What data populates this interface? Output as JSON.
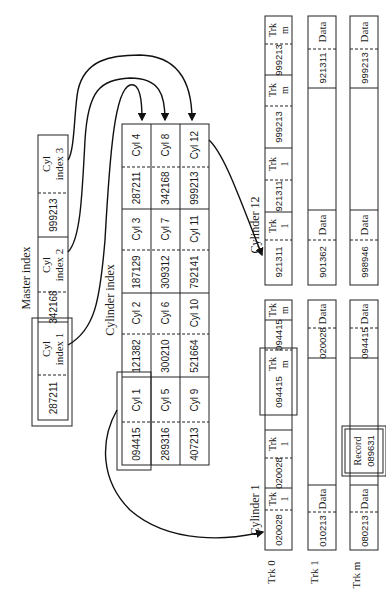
{
  "master_index": {
    "title": "Master index",
    "entries": [
      {
        "key": "287211",
        "label_line1": "Cyl",
        "label_line2": "index 1"
      },
      {
        "key": "342168",
        "label_line1": "Cyl",
        "label_line2": "index 2"
      },
      {
        "key": "999213",
        "label_line1": "Cyl",
        "label_line2": "index 3"
      }
    ]
  },
  "cylinder_index": {
    "title": "Cylinder index",
    "rows": [
      [
        {
          "key": "094415",
          "cyl": "Cyl 1"
        },
        {
          "key": "121382",
          "cyl": "Cyl 2"
        },
        {
          "key": "187129",
          "cyl": "Cyl 3"
        },
        {
          "key": "287211",
          "cyl": "Cyl 4"
        }
      ],
      [
        {
          "key": "289316",
          "cyl": "Cyl 5"
        },
        {
          "key": "300210",
          "cyl": "Cyl 6"
        },
        {
          "key": "309312",
          "cyl": "Cyl 7"
        },
        {
          "key": "342168",
          "cyl": "Cyl 8"
        }
      ],
      [
        {
          "key": "407213",
          "cyl": "Cyl 9"
        },
        {
          "key": "521664",
          "cyl": "Cyl 10"
        },
        {
          "key": "792141",
          "cyl": "Cyl 11"
        },
        {
          "key": "999213",
          "cyl": "Cyl 12"
        }
      ]
    ]
  },
  "cylinder_1": {
    "title": "Cylinder 1",
    "track_labels": [
      "Trk 0",
      "Trk 1",
      "Trk m"
    ],
    "track_index": [
      {
        "key": "020028",
        "trk": "Trk",
        "num": "1"
      },
      {
        "key": "020028",
        "trk": "Trk",
        "num": "1"
      },
      {
        "key": "094415",
        "trk": "Trk",
        "num": "m"
      },
      {
        "key": "094415",
        "trk": "Trk",
        "num": "m"
      }
    ],
    "track_1": [
      {
        "key": "010213",
        "label": "Data"
      },
      {
        "key": "020028",
        "label": "Data"
      }
    ],
    "track_m": [
      {
        "key": "080213",
        "label": "Data"
      },
      {
        "record_line1": "Record",
        "record_line2": "089631"
      },
      {
        "key": "094415",
        "label": "Data"
      }
    ]
  },
  "cylinder_12": {
    "title": "Cylinder 12",
    "track_index": [
      {
        "key": "921311",
        "trk": "Trk",
        "num": "1"
      },
      {
        "key": "921311",
        "trk": "Trk",
        "num": "1"
      },
      {
        "key": "999213",
        "trk": "Trk",
        "num": "m"
      },
      {
        "key": "999213",
        "trk": "Trk",
        "num": "m"
      }
    ],
    "track_1": [
      {
        "key": "901362",
        "label": "Data"
      },
      {
        "key": "921311",
        "label": "Data"
      }
    ],
    "track_m": [
      {
        "key": "998946",
        "label": "Data"
      },
      {
        "key": "999213",
        "label": "Data"
      }
    ]
  }
}
